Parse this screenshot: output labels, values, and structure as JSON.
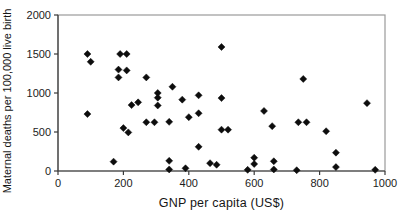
{
  "chart_data": {
    "type": "scatter",
    "title": "",
    "xlabel": "GNP per capita (US$)",
    "ylabel": "Maternal deaths per 100,000 live birth",
    "xlim": [
      0,
      1000
    ],
    "ylim": [
      0,
      2000
    ],
    "x_ticks": [
      0,
      200,
      400,
      600,
      800,
      1000
    ],
    "y_ticks": [
      0,
      500,
      1000,
      1500,
      2000
    ],
    "grid": false,
    "legend": "none",
    "marker": {
      "shape": "diamond",
      "size": 7,
      "color": "#0d0d0d"
    },
    "points": [
      [
        90,
        1500
      ],
      [
        100,
        1400
      ],
      [
        190,
        1500
      ],
      [
        210,
        1500
      ],
      [
        185,
        1300
      ],
      [
        210,
        1290
      ],
      [
        185,
        1200
      ],
      [
        270,
        1200
      ],
      [
        350,
        1080
      ],
      [
        500,
        1590
      ],
      [
        305,
        1000
      ],
      [
        305,
        940
      ],
      [
        305,
        840
      ],
      [
        225,
        845
      ],
      [
        245,
        880
      ],
      [
        380,
        915
      ],
      [
        430,
        970
      ],
      [
        500,
        935
      ],
      [
        750,
        1180
      ],
      [
        945,
        870
      ],
      [
        90,
        730
      ],
      [
        400,
        690
      ],
      [
        430,
        740
      ],
      [
        630,
        770
      ],
      [
        655,
        575
      ],
      [
        270,
        625
      ],
      [
        295,
        625
      ],
      [
        340,
        630
      ],
      [
        200,
        550
      ],
      [
        215,
        495
      ],
      [
        500,
        530
      ],
      [
        520,
        530
      ],
      [
        735,
        625
      ],
      [
        760,
        625
      ],
      [
        820,
        510
      ],
      [
        430,
        310
      ],
      [
        850,
        235
      ],
      [
        600,
        170
      ],
      [
        600,
        90
      ],
      [
        660,
        125
      ],
      [
        660,
        20
      ],
      [
        580,
        15
      ],
      [
        730,
        10
      ],
      [
        850,
        50
      ],
      [
        970,
        15
      ],
      [
        170,
        120
      ],
      [
        340,
        130
      ],
      [
        340,
        20
      ],
      [
        390,
        35
      ],
      [
        465,
        100
      ],
      [
        485,
        80
      ]
    ]
  },
  "layout": {
    "plot_left": 58,
    "plot_top": 15,
    "plot_right": 385,
    "plot_bottom": 171
  },
  "colors": {
    "frame": "#9a9a9a",
    "axis": "#3a3a3a",
    "tick": "#3a3a3a",
    "marker": "#0d0d0d",
    "background": "#ffffff"
  }
}
